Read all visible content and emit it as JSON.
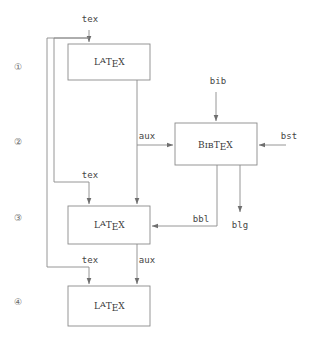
{
  "diagram": {
    "stroke_color": "#8a8a8a",
    "text_color": "#3a3a3a",
    "background": "#ffffff",
    "steps": [
      {
        "id": "step-1",
        "label": "①",
        "x": 18,
        "y": 70
      },
      {
        "id": "step-2",
        "label": "②",
        "x": 18,
        "y": 145
      },
      {
        "id": "step-3",
        "label": "③",
        "x": 18,
        "y": 221
      },
      {
        "id": "step-4",
        "label": "④",
        "x": 18,
        "y": 305
      }
    ],
    "boxes": [
      {
        "id": "box-latex-1",
        "label": "LaTeX",
        "name": "latex-box-1",
        "x": 68,
        "y": 44,
        "w": 82,
        "h": 36
      },
      {
        "id": "box-bibtex",
        "label": "BibTeX",
        "name": "bibtex-box",
        "x": 175,
        "y": 123,
        "w": 82,
        "h": 42
      },
      {
        "id": "box-latex-3",
        "label": "LaTeX",
        "name": "latex-box-3",
        "x": 68,
        "y": 206,
        "w": 82,
        "h": 38
      },
      {
        "id": "box-latex-4",
        "label": "LaTeX",
        "name": "latex-box-4",
        "x": 68,
        "y": 286,
        "w": 82,
        "h": 40
      }
    ],
    "edge_labels": [
      {
        "id": "tex-in-1",
        "text": "tex",
        "x": 90,
        "y": 22,
        "name": "edge-label-tex-input"
      },
      {
        "id": "bib-in",
        "text": "bib",
        "x": 218,
        "y": 84,
        "name": "edge-label-bib"
      },
      {
        "id": "aux-1",
        "text": "aux",
        "x": 147,
        "y": 139,
        "name": "edge-label-aux-1"
      },
      {
        "id": "bst-in",
        "text": "bst",
        "x": 289,
        "y": 139,
        "name": "edge-label-bst"
      },
      {
        "id": "tex-in-3",
        "text": "tex",
        "x": 90,
        "y": 178,
        "name": "edge-label-tex-3"
      },
      {
        "id": "bbl-out",
        "text": "bbl",
        "x": 201,
        "y": 218,
        "name": "edge-label-bbl"
      },
      {
        "id": "blg-out",
        "text": "blg",
        "x": 239,
        "y": 226,
        "name": "edge-label-blg"
      },
      {
        "id": "tex-in-4",
        "text": "tex",
        "x": 90,
        "y": 263,
        "name": "edge-label-tex-4"
      },
      {
        "id": "aux-2",
        "text": "aux",
        "x": 147,
        "y": 263,
        "name": "edge-label-aux-2"
      }
    ],
    "latex_logo": {
      "part_a": "L",
      "part_b": "A",
      "part_c": "T",
      "part_d": "E",
      "part_e": "X"
    },
    "bibtex_logo": {
      "part_a": "B",
      "part_b": "IB",
      "part_c": "T",
      "part_d": "E",
      "part_e": "X"
    }
  }
}
